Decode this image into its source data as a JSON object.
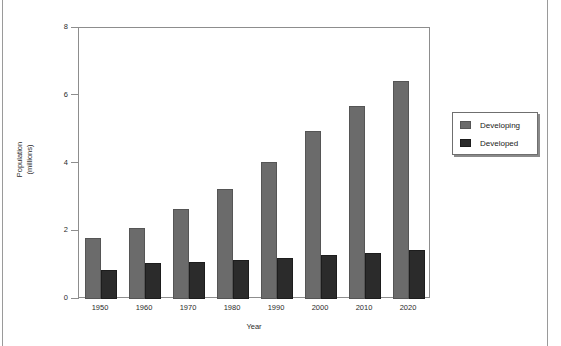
{
  "chart_data": {
    "type": "bar",
    "title": "",
    "xlabel": "Year",
    "ylabel": "Population\n(millions)",
    "ylabel_line1": "Population",
    "ylabel_line2": "(millions)",
    "categories": [
      "1950",
      "1960",
      "1970",
      "1980",
      "1990",
      "2000",
      "2010",
      "2020"
    ],
    "series": [
      {
        "name": "Developing",
        "color": "#6b6b6b",
        "values": [
          1.8,
          2.1,
          2.65,
          3.25,
          4.05,
          4.95,
          5.7,
          6.45
        ]
      },
      {
        "name": "Developed",
        "color": "#2b2b2b",
        "values": [
          0.85,
          1.05,
          1.1,
          1.15,
          1.22,
          1.3,
          1.35,
          1.45
        ]
      }
    ],
    "ylim": [
      0,
      8
    ],
    "yticks": [
      0,
      2,
      4,
      6,
      8
    ],
    "ytick_labels": [
      "0",
      "2",
      "4",
      "6",
      "8"
    ],
    "grid": false,
    "legend_position": "right-outside",
    "legend_entries": [
      "Developing",
      "Developed"
    ]
  },
  "figure": {
    "plot_background": "#ffffff",
    "frame_color": "#8d8d8d",
    "page_background": "#ffffff"
  }
}
